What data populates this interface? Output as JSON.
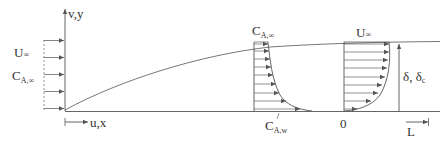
{
  "diagram": {
    "colors": {
      "line": "#555555",
      "text": "#333333",
      "background": "#ffffff"
    },
    "axes": {
      "y_label": "v,y",
      "x_label": "u,x"
    },
    "inlet_profile": {
      "velocity_label": "U",
      "velocity_sub": "∞",
      "concentration_label": "C",
      "concentration_sub": "A,∞",
      "arrow_count": 5
    },
    "concentration_profile": {
      "top_label": "C",
      "top_sub": "A,∞",
      "wall_label": "C",
      "wall_sub": "A,w",
      "arrow_count": 9
    },
    "velocity_profile": {
      "top_label": "U",
      "top_sub": "∞",
      "origin_label": "0",
      "arrow_count": 9
    },
    "thickness": {
      "label": "δ, δ",
      "label_sub": "c"
    },
    "length": {
      "label": "L"
    }
  }
}
